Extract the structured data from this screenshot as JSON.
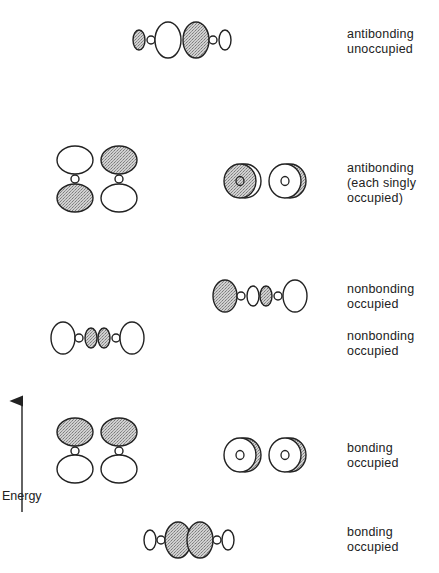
{
  "axis": {
    "label": "Energy",
    "arrow": {
      "x": 22,
      "y_start": 512,
      "y_end": 392
    }
  },
  "colors": {
    "stroke": "#222222",
    "shade_light": "#d4d4d4",
    "shade_dark": "#8c8c8c",
    "background": "#ffffff"
  },
  "levels": [
    {
      "id": "antibonding-unoccupied",
      "label_lines": [
        "antibonding",
        "unoccupied"
      ],
      "label_top": 27,
      "orbitals": [
        {
          "type": "sigma-axial",
          "shapes": [
            {
              "cx": 139,
              "cy": 40,
              "rx": 6,
              "ry": 10,
              "shaded": true
            },
            {
              "cx": 151,
              "cy": 40,
              "rx": 4,
              "ry": 4,
              "shaded": false
            },
            {
              "cx": 168,
              "cy": 40,
              "rx": 13,
              "ry": 18,
              "shaded": false
            },
            {
              "cx": 196,
              "cy": 40,
              "rx": 13,
              "ry": 18,
              "shaded": true
            },
            {
              "cx": 213,
              "cy": 40,
              "rx": 4,
              "ry": 4,
              "shaded": false
            },
            {
              "cx": 225,
              "cy": 40,
              "rx": 6,
              "ry": 10,
              "shaded": false
            }
          ]
        }
      ]
    },
    {
      "id": "antibonding-singly-occupied",
      "label_lines": [
        "antibonding",
        "(each singly",
        "occupied)"
      ],
      "label_top": 161,
      "orbitals": [
        {
          "type": "pi-vertical",
          "shapes": [
            {
              "cx": 75,
              "cy": 160,
              "rx": 18,
              "ry": 14,
              "shaded": false
            },
            {
              "cx": 75,
              "cy": 179,
              "rx": 4,
              "ry": 4,
              "shaded": false
            },
            {
              "cx": 75,
              "cy": 198,
              "rx": 18,
              "ry": 14,
              "shaded": true
            }
          ]
        },
        {
          "type": "pi-vertical",
          "shapes": [
            {
              "cx": 119,
              "cy": 160,
              "rx": 18,
              "ry": 14,
              "shaded": true
            },
            {
              "cx": 119,
              "cy": 179,
              "rx": 4,
              "ry": 4,
              "shaded": false
            },
            {
              "cx": 119,
              "cy": 198,
              "rx": 18,
              "ry": 14,
              "shaded": false
            }
          ]
        },
        {
          "type": "pi-endon",
          "cx": 240,
          "cy": 181,
          "front_shaded": true
        },
        {
          "type": "pi-endon",
          "cx": 285,
          "cy": 181,
          "front_shaded": false
        }
      ]
    },
    {
      "id": "nonbonding-occupied-upper",
      "label_lines": [
        "nonbonding",
        "occupied"
      ],
      "label_top": 282,
      "orbitals": [
        {
          "type": "sigma-axial",
          "shapes": [
            {
              "cx": 225,
              "cy": 296,
              "rx": 12,
              "ry": 16,
              "shaded": true
            },
            {
              "cx": 241,
              "cy": 296,
              "rx": 4,
              "ry": 4,
              "shaded": false
            },
            {
              "cx": 253,
              "cy": 296,
              "rx": 6,
              "ry": 10,
              "shaded": false
            },
            {
              "cx": 266,
              "cy": 296,
              "rx": 6,
              "ry": 10,
              "shaded": true
            },
            {
              "cx": 278,
              "cy": 296,
              "rx": 4,
              "ry": 4,
              "shaded": false
            },
            {
              "cx": 295,
              "cy": 296,
              "rx": 12,
              "ry": 16,
              "shaded": false
            }
          ]
        }
      ]
    },
    {
      "id": "nonbonding-occupied-lower",
      "label_lines": [
        "nonbonding",
        "occupied"
      ],
      "label_top": 329,
      "orbitals": [
        {
          "type": "sigma-axial",
          "shapes": [
            {
              "cx": 63,
              "cy": 338,
              "rx": 12,
              "ry": 16,
              "shaded": false
            },
            {
              "cx": 79,
              "cy": 338,
              "rx": 4,
              "ry": 4,
              "shaded": false
            },
            {
              "cx": 91,
              "cy": 338,
              "rx": 6,
              "ry": 10,
              "shaded": true
            },
            {
              "cx": 104,
              "cy": 338,
              "rx": 6,
              "ry": 10,
              "shaded": true
            },
            {
              "cx": 116,
              "cy": 338,
              "rx": 4,
              "ry": 4,
              "shaded": false
            },
            {
              "cx": 132,
              "cy": 338,
              "rx": 12,
              "ry": 16,
              "shaded": false
            }
          ]
        }
      ]
    },
    {
      "id": "bonding-occupied-pi",
      "label_lines": [
        "bonding",
        "occupied"
      ],
      "label_top": 441,
      "orbitals": [
        {
          "type": "pi-vertical",
          "shapes": [
            {
              "cx": 75,
              "cy": 432,
              "rx": 18,
              "ry": 14,
              "shaded": true
            },
            {
              "cx": 75,
              "cy": 451,
              "rx": 4,
              "ry": 4,
              "shaded": false
            },
            {
              "cx": 75,
              "cy": 469,
              "rx": 18,
              "ry": 14,
              "shaded": false
            }
          ]
        },
        {
          "type": "pi-vertical",
          "shapes": [
            {
              "cx": 119,
              "cy": 432,
              "rx": 18,
              "ry": 14,
              "shaded": true
            },
            {
              "cx": 119,
              "cy": 451,
              "rx": 4,
              "ry": 4,
              "shaded": false
            },
            {
              "cx": 119,
              "cy": 469,
              "rx": 18,
              "ry": 14,
              "shaded": false
            }
          ]
        },
        {
          "type": "pi-endon",
          "cx": 240,
          "cy": 455,
          "front_shaded": false
        },
        {
          "type": "pi-endon",
          "cx": 285,
          "cy": 455,
          "front_shaded": false
        }
      ]
    },
    {
      "id": "bonding-occupied-sigma",
      "label_lines": [
        "bonding",
        "occupied"
      ],
      "label_top": 525,
      "orbitals": [
        {
          "type": "sigma-axial",
          "shapes": [
            {
              "cx": 150,
              "cy": 540,
              "rx": 6,
              "ry": 10,
              "shaded": false
            },
            {
              "cx": 161,
              "cy": 540,
              "rx": 4,
              "ry": 4,
              "shaded": false
            },
            {
              "cx": 178,
              "cy": 540,
              "rx": 13,
              "ry": 18,
              "shaded": true
            },
            {
              "cx": 200,
              "cy": 540,
              "rx": 13,
              "ry": 18,
              "shaded": true
            },
            {
              "cx": 217,
              "cy": 540,
              "rx": 4,
              "ry": 4,
              "shaded": false
            },
            {
              "cx": 228,
              "cy": 540,
              "rx": 6,
              "ry": 10,
              "shaded": false
            }
          ]
        }
      ]
    }
  ]
}
